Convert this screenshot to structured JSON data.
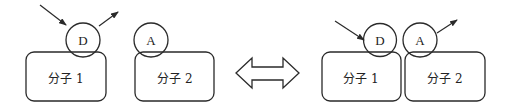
{
  "diagram": {
    "type": "molecular-interaction",
    "colors": {
      "stroke": "#2a2a2a",
      "background": "#ffffff",
      "text": "#222222"
    },
    "left_state": {
      "molecule1": {
        "label": "分子 1",
        "group": "D"
      },
      "molecule2": {
        "label": "分子 2",
        "group": "A"
      }
    },
    "equilibrium_arrow": "double-arrow",
    "right_state": {
      "molecule1": {
        "label": "分子 1",
        "group": "D"
      },
      "molecule2": {
        "label": "分子 2",
        "group": "A"
      }
    }
  }
}
